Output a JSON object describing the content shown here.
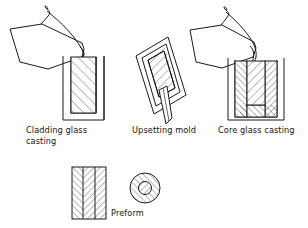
{
  "figure": {
    "background_color": "#ffffff",
    "line_color": "#1a1a1a",
    "hatch_color": "#2b2b2b",
    "width": 308,
    "height": 228
  },
  "stages": [
    {
      "id": "cladding-glass-casting",
      "label_line1": "Cladding glass",
      "label_line2": "casting",
      "label_full": "Cladding glass casting",
      "elements": [
        "pouring-ladle",
        "crucible",
        "diagonal-hatch-fill"
      ]
    },
    {
      "id": "upsetting-mold",
      "label_line1": "Upsetting mold",
      "label_line2": "",
      "label_full": "Upsetting mold",
      "elements": [
        "tilted-mold-frame",
        "inner-frame",
        "diagonal-hatch-fill",
        "stem"
      ]
    },
    {
      "id": "core-glass-casting",
      "label_line1": "Core glass casting",
      "label_line2": "",
      "label_full": "Core glass casting",
      "elements": [
        "pouring-ladle",
        "crucible",
        "u-shaped-cladding-layer",
        "core-fill"
      ]
    },
    {
      "id": "preform",
      "label_line1": "Preform",
      "label_line2": "",
      "label_full": "Preform",
      "elements": [
        "preform-rod",
        "herringbone-hatch",
        "cross-section-circle"
      ]
    }
  ],
  "captions": {
    "cladding_line1": "Cladding glass",
    "cladding_line2": "casting",
    "upsetting": "Upsetting mold",
    "core": "Core glass casting",
    "preform": "Preform"
  }
}
